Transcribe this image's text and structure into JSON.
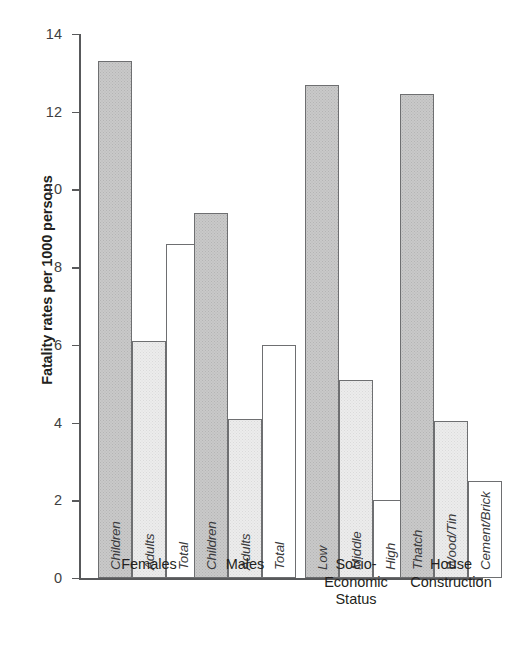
{
  "chart_data": {
    "type": "bar",
    "title": "",
    "xlabel": "",
    "ylabel": "Fatality rates per 1000 persons",
    "ylim": [
      0,
      14
    ],
    "yticks": [
      0,
      2,
      4,
      6,
      8,
      10,
      12,
      14
    ],
    "ytick_labels": [
      "0",
      "2",
      "4",
      "6",
      "8",
      "10",
      "12",
      "14"
    ],
    "grid": false,
    "legend": "none",
    "bar_fill_styles": {
      "dark": "medium-gray-halftone",
      "light": "light-gray-halftone",
      "open": "white-unfilled"
    },
    "groups": [
      {
        "name": "Females",
        "label_lines": [
          "Females"
        ],
        "bars": [
          {
            "label": "Children",
            "value": 13.3,
            "fill": "dark"
          },
          {
            "label": "Adults",
            "value": 6.1,
            "fill": "light"
          },
          {
            "label": "Total",
            "value": 8.6,
            "fill": "open"
          }
        ]
      },
      {
        "name": "Males",
        "label_lines": [
          "Males"
        ],
        "bars": [
          {
            "label": "Children",
            "value": 9.4,
            "fill": "dark"
          },
          {
            "label": "Adults",
            "value": 4.1,
            "fill": "light"
          },
          {
            "label": "Total",
            "value": 6.0,
            "fill": "open"
          }
        ]
      },
      {
        "name": "Socio-Economic Status",
        "label_lines": [
          "Socio-",
          "Economic",
          "Status"
        ],
        "bars": [
          {
            "label": "Low",
            "value": 12.7,
            "fill": "dark"
          },
          {
            "label": "Middle",
            "value": 5.1,
            "fill": "light"
          },
          {
            "label": "High",
            "value": 2.0,
            "fill": "open"
          }
        ]
      },
      {
        "name": "House Construction",
        "label_lines": [
          "House",
          "Construction"
        ],
        "bars": [
          {
            "label": "Thatch",
            "value": 12.45,
            "fill": "dark"
          },
          {
            "label": "Wood/Tin",
            "value": 4.05,
            "fill": "light"
          },
          {
            "label": "Cement/Brick",
            "value": 2.5,
            "fill": "open"
          }
        ]
      }
    ]
  },
  "colors": {
    "axis": "#58595b",
    "text": "#231f20",
    "bar_outline": "#6e6f71",
    "bar_dark": "#c9c9c9",
    "bar_light": "#ececec",
    "bar_open": "#ffffff",
    "background": "#ffffff"
  }
}
